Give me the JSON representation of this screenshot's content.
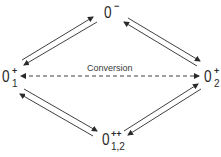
{
  "diagram": {
    "nodes": {
      "top": {
        "base": "0",
        "sup": "−",
        "sub": ""
      },
      "left": {
        "base": "0",
        "sup": "+",
        "sub": "1"
      },
      "right": {
        "base": "0",
        "sup": "+",
        "sub": "2"
      },
      "bottom": {
        "base": "0",
        "sup": "++",
        "sub": "1,2"
      }
    },
    "conversion_label": "Conversion",
    "edges": [
      {
        "from": "left",
        "to": "top",
        "style": "double-arrow-pair"
      },
      {
        "from": "top",
        "to": "right",
        "style": "double-arrow-pair"
      },
      {
        "from": "left",
        "to": "bottom",
        "style": "double-arrow-pair"
      },
      {
        "from": "bottom",
        "to": "right",
        "style": "double-arrow-pair"
      },
      {
        "from": "left",
        "to": "right",
        "style": "dashed-bidirectional",
        "label": "Conversion"
      }
    ],
    "line_color": "#2a2a2a"
  }
}
